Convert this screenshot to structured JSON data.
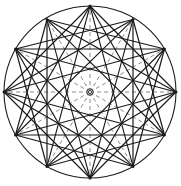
{
  "figure": {
    "canvas": {
      "width": 181,
      "height": 186
    },
    "background_color": "#ffffff"
  },
  "chart_data": {
    "type": "diagram",
    "geometry": {
      "center": {
        "x": 90,
        "y": 92
      },
      "radius": 86,
      "vertex_count": 12,
      "angle_step_degrees": 30,
      "start_angle_degrees": -90,
      "vertex_labels": [
        "V0",
        "V1",
        "V2",
        "V3",
        "V4",
        "V5",
        "V6",
        "V7",
        "V8",
        "V9",
        "V10",
        "V11"
      ],
      "vertex_angles_degrees": [
        -90,
        -60,
        -30,
        0,
        30,
        60,
        90,
        120,
        150,
        180,
        210,
        240
      ],
      "vertices": [
        {
          "label": "V0",
          "angle": -90,
          "x": 90,
          "y": 6
        },
        {
          "label": "V1",
          "angle": -60,
          "x": 133,
          "y": 19.53
        },
        {
          "label": "V2",
          "angle": -30,
          "x": 164.47,
          "y": 49
        },
        {
          "label": "V3",
          "angle": 0,
          "x": 176,
          "y": 92
        },
        {
          "label": "V4",
          "angle": 30,
          "x": 164.47,
          "y": 135
        },
        {
          "label": "V5",
          "angle": 60,
          "x": 133,
          "y": 166.47
        },
        {
          "label": "V6",
          "angle": 90,
          "x": 90,
          "y": 178
        },
        {
          "label": "V7",
          "angle": 120,
          "x": 47,
          "y": 166.47
        },
        {
          "label": "V8",
          "angle": 150,
          "x": 15.53,
          "y": 135
        },
        {
          "label": "V9",
          "angle": 180,
          "x": 4,
          "y": 92
        },
        {
          "label": "V10",
          "angle": 210,
          "x": 15.53,
          "y": 49
        },
        {
          "label": "V11",
          "angle": 240,
          "x": 47,
          "y": 19.53
        }
      ]
    },
    "center_marker": {
      "name": "center-point",
      "outer_radius": 3.2,
      "inner_radius": 1.6,
      "color": "#1a1a1a"
    },
    "elements": [
      {
        "name": "circumcircle",
        "kind": "circle",
        "style": "solid",
        "color": "#1a1a1a",
        "stroke_width": 1.1
      },
      {
        "name": "radial-spokes",
        "kind": "radii",
        "style": "dashed",
        "color": "#8a8a8a",
        "stroke_width": 1.0,
        "dash": "4,3",
        "count": 12,
        "description": "Twelve dashed radii from center to each polygon vertex at 30 degree intervals"
      },
      {
        "name": "star-polygon-skip-3",
        "kind": "chords",
        "skip": 3,
        "style": "solid",
        "color": "#1a1a1a",
        "stroke_width": 1.2,
        "description": "Chords joining every 3rd vertex forming three overlapping squares"
      },
      {
        "name": "star-polygon-skip-4",
        "kind": "chords",
        "skip": 4,
        "style": "solid",
        "color": "#1a1a1a",
        "stroke_width": 1.2,
        "description": "Chords joining every 4th vertex forming four overlapping triangles"
      },
      {
        "name": "star-polygon-skip-5",
        "kind": "chords",
        "skip": 5,
        "style": "solid",
        "color": "#1a1a1a",
        "stroke_width": 1.1,
        "description": "Chords joining every 5th vertex forming the 12/5 star polygon"
      }
    ],
    "colors": {
      "line": "#1a1a1a",
      "dashed_line": "#8a8a8a",
      "background": "#ffffff",
      "vertex": "#1a1a1a"
    },
    "grid": false,
    "legend": null,
    "annotations": []
  }
}
